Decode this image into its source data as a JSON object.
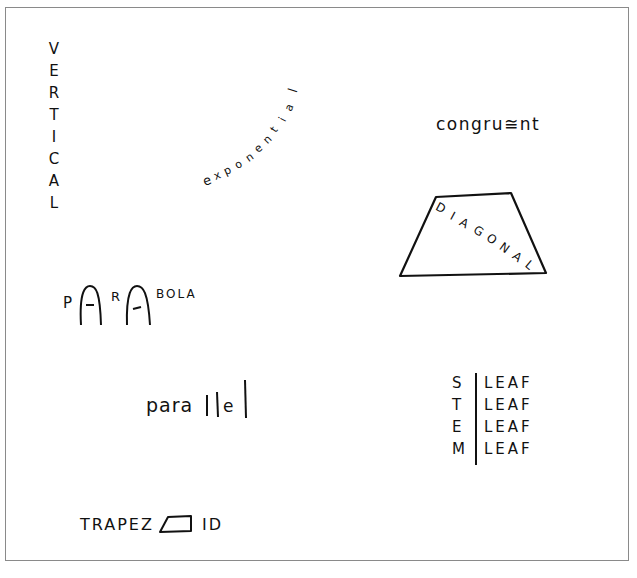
{
  "illustration": {
    "vertical": {
      "word": "VERTICAL",
      "letters": [
        "V",
        "E",
        "R",
        "T",
        "I",
        "C",
        "A",
        "L"
      ]
    },
    "exponential": {
      "word": "exponential",
      "letters": [
        "e",
        "x",
        "p",
        "o",
        "n",
        "e",
        "n",
        "t",
        "i",
        "a",
        "l"
      ]
    },
    "congruent": {
      "word": "congru≅nt"
    },
    "diagonal": {
      "word": "DIAGONAL",
      "letters": [
        "D",
        "I",
        "A",
        "G",
        "O",
        "N",
        "A",
        "L"
      ]
    },
    "parabola": {
      "p": "P",
      "r": "R",
      "tail": "BOLA"
    },
    "parallel": {
      "prefix": "para",
      "mid": "e"
    },
    "stem_leaf": {
      "stems": [
        "S",
        "T",
        "E",
        "M"
      ],
      "leaves": [
        "LEAF",
        "LEAF",
        "LEAF",
        "LEAF"
      ]
    },
    "trapezoid": {
      "prefix": "TRAPEZ",
      "suffix": "ID"
    }
  },
  "colors": {
    "ink": "#111111",
    "frame": "#8a8a8a",
    "background": "#ffffff"
  }
}
